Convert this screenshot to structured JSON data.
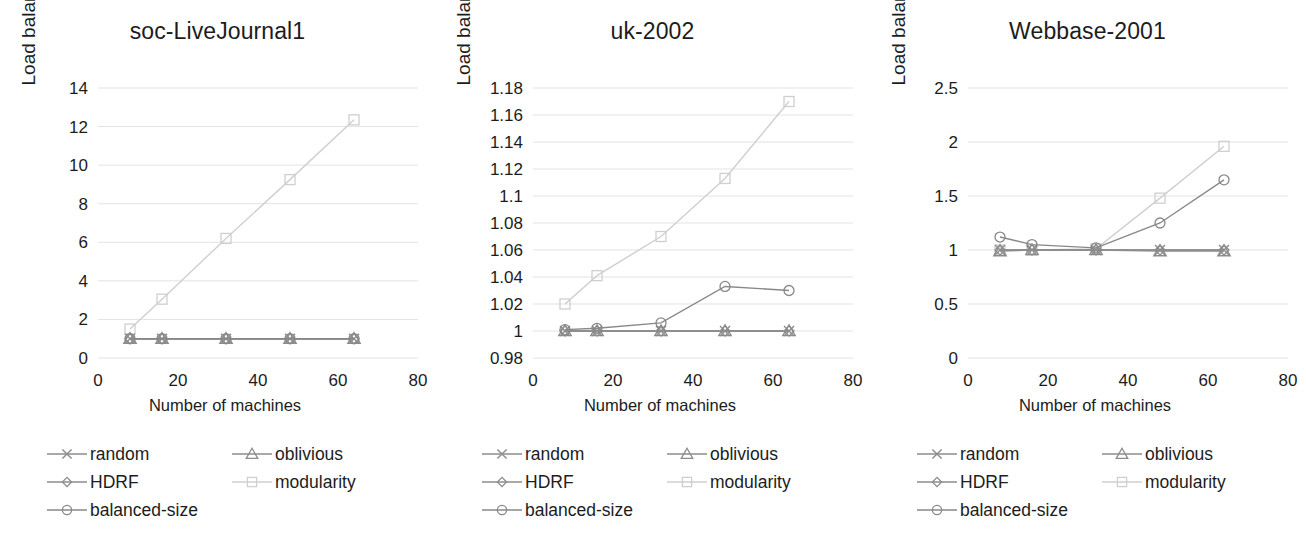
{
  "figure": {
    "background": "#ffffff",
    "panel_count": 3
  },
  "common": {
    "xlabel": "Number of machines",
    "ylabel": "Load balance factor",
    "xticks": [
      "0",
      "20",
      "40",
      "60",
      "80"
    ],
    "xlim": [
      0,
      80
    ],
    "x_values": [
      8,
      16,
      32,
      48,
      64
    ]
  },
  "series_styles": [
    {
      "name": "random",
      "marker": "cross",
      "color": "#8c8c8c"
    },
    {
      "name": "oblivious",
      "marker": "triangle",
      "color": "#8c8c8c"
    },
    {
      "name": "HDRF",
      "marker": "diamond",
      "color": "#8c8c8c"
    },
    {
      "name": "modularity",
      "marker": "square",
      "color": "#cfcfcf"
    },
    {
      "name": "balanced-size",
      "marker": "circle",
      "color": "#888888"
    }
  ],
  "legend": {
    "entries": [
      {
        "label": "random",
        "marker": "cross",
        "color": "#8c8c8c"
      },
      {
        "label": "oblivious",
        "marker": "triangle",
        "color": "#8c8c8c"
      },
      {
        "label": "HDRF",
        "marker": "diamond",
        "color": "#8c8c8c"
      },
      {
        "label": "modularity",
        "marker": "square",
        "color": "#cfcfcf"
      },
      {
        "label": "balanced-size",
        "marker": "circle",
        "color": "#888888"
      }
    ]
  },
  "chart_data": [
    {
      "type": "line",
      "title": "soc-LiveJournal1",
      "xlabel": "Number of machines",
      "ylabel": "Load balance factor",
      "x": [
        8,
        16,
        32,
        48,
        64
      ],
      "xlim": [
        0,
        80
      ],
      "xticks": [
        0,
        20,
        40,
        60,
        80
      ],
      "ylim": [
        0,
        14
      ],
      "yticks": [
        0,
        2,
        4,
        6,
        8,
        10,
        12,
        14
      ],
      "ytick_labels": [
        "0",
        "2",
        "4",
        "6",
        "8",
        "10",
        "12",
        "14"
      ],
      "grid": true,
      "legend_position": "bottom",
      "series": [
        {
          "name": "random",
          "values": [
            1.0,
            1.0,
            1.0,
            1.0,
            1.0
          ]
        },
        {
          "name": "oblivious",
          "values": [
            1.0,
            1.0,
            1.0,
            1.0,
            1.0
          ]
        },
        {
          "name": "HDRF",
          "values": [
            1.0,
            1.0,
            1.0,
            1.0,
            1.0
          ]
        },
        {
          "name": "modularity",
          "values": [
            1.5,
            3.05,
            6.2,
            9.25,
            12.35
          ]
        },
        {
          "name": "balanced-size",
          "values": [
            1.0,
            1.0,
            1.0,
            1.0,
            1.0
          ]
        }
      ]
    },
    {
      "type": "line",
      "title": "uk-2002",
      "xlabel": "Number of machines",
      "ylabel": "Load balance factor",
      "x": [
        8,
        16,
        32,
        48,
        64
      ],
      "xlim": [
        0,
        80
      ],
      "xticks": [
        0,
        20,
        40,
        60,
        80
      ],
      "ylim": [
        0.98,
        1.18
      ],
      "yticks": [
        0.98,
        1.0,
        1.02,
        1.04,
        1.06,
        1.08,
        1.1,
        1.12,
        1.14,
        1.16,
        1.18
      ],
      "ytick_labels": [
        "0.98",
        "1",
        "1.02",
        "1.04",
        "1.06",
        "1.08",
        "1.1",
        "1.12",
        "1.14",
        "1.16",
        "1.18"
      ],
      "grid": true,
      "legend_position": "bottom",
      "series": [
        {
          "name": "random",
          "values": [
            1.0,
            1.0,
            1.0,
            1.0,
            1.0
          ]
        },
        {
          "name": "oblivious",
          "values": [
            1.0,
            1.0,
            1.0,
            1.0,
            1.0
          ]
        },
        {
          "name": "HDRF",
          "values": [
            1.0,
            1.0,
            1.0,
            1.0,
            1.0
          ]
        },
        {
          "name": "modularity",
          "values": [
            1.02,
            1.041,
            1.07,
            1.113,
            1.17
          ]
        },
        {
          "name": "balanced-size",
          "values": [
            1.001,
            1.002,
            1.006,
            1.033,
            1.03
          ]
        }
      ]
    },
    {
      "type": "line",
      "title": "Webbase-2001",
      "xlabel": "Number of machines",
      "ylabel": "Load balance factor",
      "x": [
        8,
        16,
        32,
        48,
        64
      ],
      "xlim": [
        0,
        80
      ],
      "xticks": [
        0,
        20,
        40,
        60,
        80
      ],
      "ylim": [
        0,
        2.5
      ],
      "yticks": [
        0,
        0.5,
        1.0,
        1.5,
        2.0,
        2.5
      ],
      "ytick_labels": [
        "0",
        "0.5",
        "1",
        "1.5",
        "2",
        "2.5"
      ],
      "grid": true,
      "legend_position": "bottom",
      "series": [
        {
          "name": "random",
          "values": [
            1.0,
            1.0,
            1.0,
            1.0,
            1.0
          ]
        },
        {
          "name": "oblivious",
          "values": [
            0.99,
            1.0,
            1.0,
            0.99,
            0.99
          ]
        },
        {
          "name": "HDRF",
          "values": [
            1.0,
            1.0,
            1.0,
            1.0,
            1.0
          ]
        },
        {
          "name": "modularity",
          "values": [
            1.0,
            1.0,
            1.01,
            1.48,
            1.96
          ]
        },
        {
          "name": "balanced-size",
          "values": [
            1.12,
            1.05,
            1.02,
            1.25,
            1.65
          ]
        }
      ]
    }
  ]
}
